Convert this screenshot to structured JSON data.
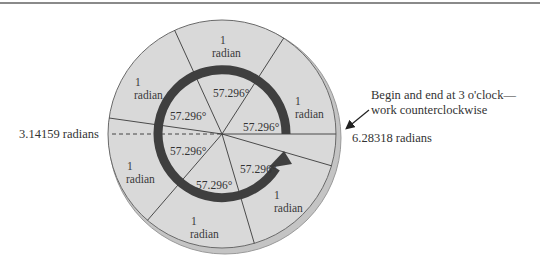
{
  "diagram": {
    "colors": {
      "disc_fill": "#d9d9d9",
      "disc_rim": "#b8b8b8",
      "spoke": "#333333",
      "ring": "#3f3f3f",
      "text": "#333333"
    },
    "sector_labels": [
      {
        "number": "1",
        "unit": "radian"
      },
      {
        "number": "1",
        "unit": "radian"
      },
      {
        "number": "1",
        "unit": "radian"
      },
      {
        "number": "1",
        "unit": "radian"
      },
      {
        "number": "1",
        "unit": "radian"
      },
      {
        "number": "1",
        "unit": "radian"
      }
    ],
    "degree_labels": [
      "57.296°",
      "57.296°",
      "57.296°",
      "57.296°",
      "57.296°",
      "57.296°",
      "57.296°"
    ],
    "left_label": "3.14159 radians",
    "right_label": "6.28318 radians",
    "note": {
      "line1": "Begin and end at 3 o'clock—",
      "line2": "work counterclockwise"
    }
  }
}
